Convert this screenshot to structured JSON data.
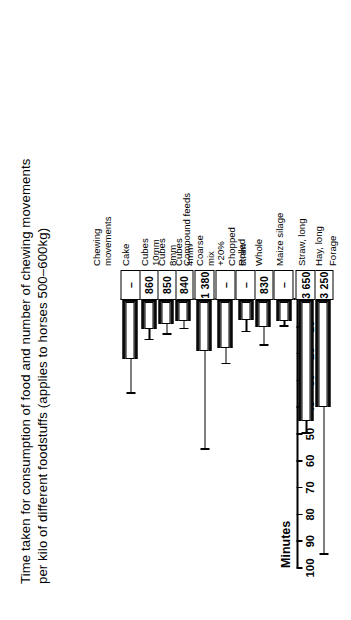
{
  "chart_data": {
    "type": "bar",
    "title": "Time taken for consumption of food and number of chewing movements per kilo of different foodstuffs (applies to horses 500–600kg)",
    "orientation": "vertical-rotated",
    "ylabel": "Minutes",
    "xlabel": "",
    "ylim": [
      0,
      100
    ],
    "yticks": [
      10,
      20,
      30,
      40,
      50,
      60,
      70,
      80,
      90,
      100
    ],
    "ytick_labels": [
      "10",
      "20",
      "30",
      "40",
      "50",
      "60",
      "70",
      "80",
      "90",
      "100"
    ],
    "grid": false,
    "legend": "Chewing movements",
    "value_row_label": "Chewing movements",
    "categories": [
      "Hay, long",
      "Straw, long",
      "Maize silage",
      "Whole",
      "Rolled",
      "+20%\nChopped\nstraw",
      "Coarse\nmix",
      "Cubes\n4mm",
      "Cubes\n8mm",
      "Cubes\n10mm",
      "Cake"
    ],
    "values": [
      40,
      45,
      8,
      10,
      7.5,
      18,
      19,
      8,
      9,
      11,
      22
    ],
    "errors_high": [
      95,
      50,
      10,
      17,
      12,
      24,
      56,
      11,
      13,
      15,
      35
    ],
    "chewing_movements": [
      "3 250",
      "3 650",
      "–",
      "830",
      "–",
      "–",
      "1 380",
      "840",
      "850",
      "860",
      "–"
    ],
    "groups": [
      {
        "label": "Forage",
        "members": [
          "Hay, long",
          "Straw, long"
        ]
      },
      {
        "label": "Oats",
        "members": [
          "Whole",
          "Rolled"
        ]
      },
      {
        "label": "Compound feeds",
        "members": [
          "Cubes 4mm",
          "Cubes 8mm",
          "Cubes 10mm"
        ]
      }
    ],
    "series": [
      {
        "name": "Minutes per kilo",
        "values": [
          40,
          45,
          8,
          10,
          7.5,
          18,
          19,
          8,
          9,
          11,
          22
        ]
      }
    ],
    "colors": {
      "bar_fill": "#111111",
      "bar_inner": "#ffffff",
      "axis": "#000000",
      "background": "#ffffff"
    }
  },
  "axis": {
    "value_axis_title": "Minutes",
    "ticks": [
      "100",
      "90",
      "80",
      "70",
      "60",
      "50",
      "40",
      "30",
      "20",
      "10"
    ]
  },
  "labels": {
    "group_forage": "Forage",
    "group_oats": "Oats",
    "group_compound": "Compound feeds",
    "legend_chewing": "Chewing\nmovements",
    "cat_hay": "Hay, long",
    "cat_straw": "Straw, long",
    "cat_maize": "Maize silage",
    "cat_whole": "Whole",
    "cat_rolled": "Rolled",
    "cat_chopped": "+20%\nChopped\nstraw",
    "cat_coarse": "Coarse\nmix",
    "cat_cubes4": "Cubes\n4mm",
    "cat_cubes8": "Cubes\n8mm",
    "cat_cubes10": "Cubes\n10mm",
    "cat_cake": "Cake"
  },
  "values_row": {
    "hay": "3 250",
    "straw": "3 650",
    "maize": "–",
    "whole": "830",
    "rolled": "–",
    "chopped": "–",
    "coarse": "1 380",
    "cubes4": "840",
    "cubes8": "850",
    "cubes10": "860",
    "cake": "–"
  }
}
